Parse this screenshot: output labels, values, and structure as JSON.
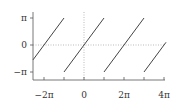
{
  "chart_data": {
    "type": "line",
    "title": "",
    "xlabel": "",
    "ylabel": "",
    "xlim_pi": [
      -2.55,
      4.1
    ],
    "ylim_pi": [
      -1.25,
      1.25
    ],
    "x_ticks": [
      {
        "value_pi": -2,
        "label": "−2π"
      },
      {
        "value_pi": -1,
        "label": ""
      },
      {
        "value_pi": 0,
        "label": "0"
      },
      {
        "value_pi": 1,
        "label": ""
      },
      {
        "value_pi": 2,
        "label": "2π"
      },
      {
        "value_pi": 3,
        "label": ""
      },
      {
        "value_pi": 4,
        "label": "4π"
      }
    ],
    "y_ticks": [
      {
        "value_pi": 1,
        "label": "π"
      },
      {
        "value_pi": 0,
        "label": "0"
      },
      {
        "value_pi": -1,
        "label": "−π"
      }
    ],
    "reference_lines": {
      "x0_dotted": true,
      "y0_dotted": true
    },
    "series": [
      {
        "name": "segment-1",
        "x_pi": [
          -2.55,
          -1
        ],
        "y_pi": [
          -0.55,
          1
        ]
      },
      {
        "name": "segment-2",
        "x_pi": [
          -1,
          1
        ],
        "y_pi": [
          -1,
          1
        ]
      },
      {
        "name": "segment-3",
        "x_pi": [
          1,
          3
        ],
        "y_pi": [
          -1,
          1
        ]
      },
      {
        "name": "segment-4",
        "x_pi": [
          3,
          4.1
        ],
        "y_pi": [
          -1,
          0.1
        ]
      }
    ],
    "grid": false,
    "legend": null,
    "colors": {
      "curve": "#444444",
      "axis": "#555555",
      "reference": "#aaaaaa"
    }
  }
}
